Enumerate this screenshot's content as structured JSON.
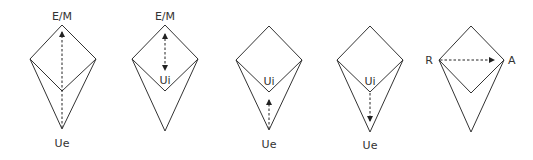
{
  "diagrams": [
    {
      "name": "diagram-1",
      "vertices": {
        "top": [
          62,
          25
        ],
        "left": [
          30,
          59
        ],
        "right": [
          96,
          59
        ],
        "inner": [
          62,
          91
        ],
        "bottom": [
          62,
          129
        ]
      },
      "labels": [
        {
          "text": "E/M",
          "x": 62,
          "y": 20,
          "anchor": "middle"
        },
        {
          "text": "Ue",
          "x": 62,
          "y": 147,
          "anchor": "middle"
        }
      ],
      "arrows": [
        {
          "x1": 62,
          "y1": 128,
          "x2": 62,
          "y2": 32,
          "head_start": false,
          "head_end": true
        }
      ]
    },
    {
      "name": "diagram-2",
      "vertices": {
        "top": [
          165,
          25
        ],
        "left": [
          132,
          59
        ],
        "right": [
          198,
          59
        ],
        "inner": [
          165,
          91
        ],
        "bottom": [
          165,
          131
        ]
      },
      "labels": [
        {
          "text": "E/M",
          "x": 165,
          "y": 20,
          "anchor": "middle"
        },
        {
          "text": "Ui",
          "x": 165,
          "y": 84,
          "anchor": "middle"
        }
      ],
      "arrows": [
        {
          "x1": 165,
          "y1": 34,
          "x2": 165,
          "y2": 70,
          "head_start": true,
          "head_end": true
        }
      ]
    },
    {
      "name": "diagram-3",
      "vertices": {
        "top": [
          269,
          26
        ],
        "left": [
          236,
          60
        ],
        "right": [
          302,
          60
        ],
        "inner": [
          269,
          92
        ],
        "bottom": [
          269,
          130
        ]
      },
      "labels": [
        {
          "text": "Ui",
          "x": 269,
          "y": 85,
          "anchor": "middle"
        },
        {
          "text": "Ue",
          "x": 269,
          "y": 148,
          "anchor": "middle"
        }
      ],
      "arrows": [
        {
          "x1": 269,
          "y1": 129,
          "x2": 269,
          "y2": 100,
          "head_start": false,
          "head_end": true
        }
      ]
    },
    {
      "name": "diagram-4",
      "vertices": {
        "top": [
          370,
          26
        ],
        "left": [
          337,
          60
        ],
        "right": [
          403,
          60
        ],
        "inner": [
          370,
          92
        ],
        "bottom": [
          370,
          132
        ]
      },
      "labels": [
        {
          "text": "Ui",
          "x": 370,
          "y": 85,
          "anchor": "middle"
        },
        {
          "text": "Ue",
          "x": 370,
          "y": 149,
          "anchor": "middle"
        }
      ],
      "arrows": [
        {
          "x1": 370,
          "y1": 93,
          "x2": 370,
          "y2": 121,
          "head_start": false,
          "head_end": true
        }
      ]
    },
    {
      "name": "diagram-5",
      "vertices": {
        "top": [
          471,
          26
        ],
        "left": [
          439,
          60
        ],
        "right": [
          504,
          60
        ],
        "inner": [
          471,
          93
        ],
        "bottom": [
          471,
          132
        ]
      },
      "labels": [
        {
          "text": "R",
          "x": 433,
          "y": 64,
          "anchor": "end"
        },
        {
          "text": "A",
          "x": 508,
          "y": 64,
          "anchor": "start"
        }
      ],
      "arrows": [
        {
          "x1": 440,
          "y1": 60,
          "x2": 494,
          "y2": 60,
          "head_start": false,
          "head_end": true
        }
      ]
    }
  ]
}
